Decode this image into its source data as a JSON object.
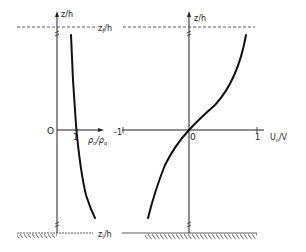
{
  "diagram": {
    "left_panel": {
      "y_axis_label": "z/h",
      "x_axis_label_num": "ρ",
      "x_axis_label": "ρ_o/ρ_q",
      "origin_label": "O",
      "tick_label_1": "1",
      "curve": "density ratio profile, nearly vertical, slightly increasing with depth"
    },
    "right_panel": {
      "y_axis_label": "z/h",
      "x_axis_label": "U_o/V",
      "origin_label": "O",
      "tick_label_neg1": "-1",
      "tick_label_1": "1",
      "curve": "S-shaped velocity profile from negative near bottom to positive near top, passing through origin"
    },
    "top_boundary_label": "z_f/h",
    "bottom_boundary_label": "z_i/h",
    "colors": {
      "ink": "#222222",
      "background": "#ffffff"
    }
  },
  "labels": {
    "z_h_left": "z/h",
    "z_h_right": "z/h",
    "zf_main": "z",
    "zf_sub": "f",
    "zf_tail": "/h",
    "zi_main": "z",
    "zi_sub": "i",
    "zi_tail": "/h",
    "origin_left": "O",
    "origin_right": "0",
    "left_tick_1": "1",
    "rho_num": "ρ",
    "rho_num_sub": "o",
    "rho_den": "ρ",
    "rho_den_sub": "q",
    "slash": "/",
    "right_tick_neg1": "-1",
    "right_tick_1": "1",
    "u_main": "U",
    "u_sub": "o",
    "u_tail": "/V"
  }
}
